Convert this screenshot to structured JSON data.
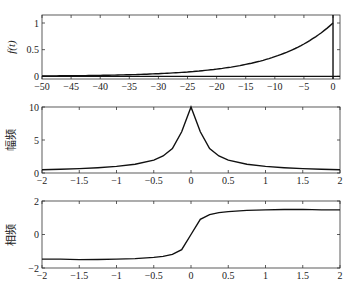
{
  "chart_data": [
    {
      "type": "line",
      "title": "",
      "xlabel": "",
      "ylabel": "f(t)",
      "xlim": [
        -50,
        1.2
      ],
      "ylim": [
        -0.05,
        1.15
      ],
      "xticks": [
        -50,
        -45,
        -40,
        -35,
        -30,
        -25,
        -20,
        -15,
        -10,
        -5,
        0
      ],
      "yticks": [
        0,
        0.5,
        1
      ],
      "ytick_labels": [
        "0",
        "0.5",
        "1"
      ],
      "annotations": [
        "vertical line at t = 0",
        "horizontal line at f = 0"
      ],
      "series": [
        {
          "name": "f(t)",
          "x": [
            -50,
            -45,
            -40,
            -35,
            -30,
            -25,
            -20,
            -15,
            -10,
            -8,
            -6,
            -4,
            -2,
            0
          ],
          "y": [
            0.007,
            0.011,
            0.018,
            0.03,
            0.05,
            0.082,
            0.135,
            0.223,
            0.368,
            0.449,
            0.549,
            0.67,
            0.819,
            1.0
          ]
        }
      ]
    },
    {
      "type": "line",
      "title": "",
      "xlabel": "",
      "ylabel": "幅频",
      "xlim": [
        -2,
        2
      ],
      "ylim": [
        0,
        10
      ],
      "xticks": [
        -2,
        -1.5,
        -1,
        -0.5,
        0,
        0.5,
        1,
        1.5,
        2
      ],
      "yticks": [
        0,
        5,
        10
      ],
      "series": [
        {
          "name": "amplitude",
          "x": [
            -2,
            -1.75,
            -1.5,
            -1.25,
            -1,
            -0.75,
            -0.5,
            -0.375,
            -0.25,
            -0.125,
            0,
            0.125,
            0.25,
            0.375,
            0.5,
            0.75,
            1,
            1.25,
            1.5,
            1.75,
            2
          ],
          "y": [
            0.5,
            0.57,
            0.66,
            0.8,
            1.0,
            1.32,
            1.96,
            2.58,
            3.71,
            6.25,
            10,
            6.25,
            3.71,
            2.58,
            1.96,
            1.32,
            1.0,
            0.8,
            0.66,
            0.57,
            0.5
          ]
        }
      ]
    },
    {
      "type": "line",
      "title": "",
      "xlabel": "",
      "ylabel": "相频",
      "xlim": [
        -2,
        2
      ],
      "ylim": [
        -2,
        2
      ],
      "xticks": [
        -2,
        -1.5,
        -1,
        -0.5,
        0,
        0.5,
        1,
        1.5,
        2
      ],
      "yticks": [
        -2,
        0,
        2
      ],
      "series": [
        {
          "name": "phase",
          "x": [
            -2,
            -1.75,
            -1.5,
            -1.25,
            -1,
            -0.75,
            -0.5,
            -0.375,
            -0.25,
            -0.125,
            0,
            0.125,
            0.25,
            0.375,
            0.5,
            0.75,
            1,
            1.25,
            1.5,
            1.75,
            2
          ],
          "y": [
            -1.47,
            -1.47,
            -1.5,
            -1.49,
            -1.47,
            -1.44,
            -1.37,
            -1.31,
            -1.19,
            -0.9,
            0,
            0.9,
            1.19,
            1.31,
            1.37,
            1.44,
            1.47,
            1.49,
            1.5,
            1.47,
            1.47
          ]
        }
      ]
    }
  ]
}
